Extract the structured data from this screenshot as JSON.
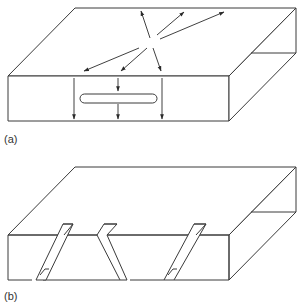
{
  "figure": {
    "panels": [
      {
        "label": "(a)",
        "description": "Rectangular slab with a horizontal slot in the front face; arrows radiate outward on the top surface and point downward on the front face",
        "elements": [
          "slab",
          "slot",
          "radiating-arrows",
          "downward-arrows"
        ]
      },
      {
        "label": "(b)",
        "description": "Rectangular slab with three inclined notches/cuts through the front face",
        "elements": [
          "slab",
          "inclined-cuts"
        ]
      }
    ],
    "colors": {
      "line": "#3a3a3a",
      "background": "#ffffff"
    }
  }
}
